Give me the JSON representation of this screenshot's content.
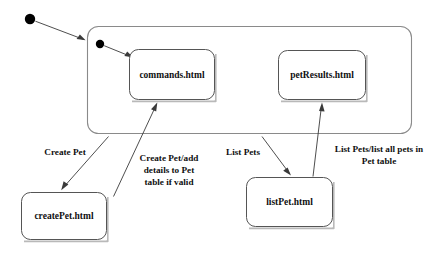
{
  "diagram": {
    "type": "uml-statechart",
    "title_visible": false,
    "background_color": "#ffffff",
    "line_color": "#3a3a3a",
    "box_stroke_color": "#555555",
    "container_stroke_color": "#8a8a8a",
    "text_color": "#101010",
    "outer_start": {
      "name": "outer-initial-state",
      "shape": "filled-circle",
      "cx": 30,
      "cy": 19,
      "r": 5.2
    },
    "container": {
      "name": "composite-state",
      "label": "",
      "x": 87,
      "y": 26,
      "width": 325,
      "height": 108,
      "radius": 11
    },
    "inner_start": {
      "name": "inner-initial-state",
      "shape": "filled-circle",
      "cx": 100,
      "cy": 44,
      "r": 4.2
    },
    "states": [
      {
        "id": "commands",
        "label": "commands.html",
        "x": 129,
        "y": 49,
        "width": 86,
        "height": 51,
        "radius": 9
      },
      {
        "id": "petResults",
        "label": "petResults.html",
        "x": 278,
        "y": 50,
        "width": 88,
        "height": 50,
        "radius": 9
      },
      {
        "id": "createPet",
        "label": "createPet.html",
        "x": 21,
        "y": 192,
        "width": 86,
        "height": 48,
        "radius": 9
      },
      {
        "id": "listPet",
        "label": "listPet.html",
        "x": 246,
        "y": 177,
        "width": 87,
        "height": 50,
        "radius": 9
      }
    ],
    "transitions": [
      {
        "id": "start-to-container",
        "from": "outer-initial-state",
        "to": "composite-state",
        "label": "",
        "points": "35,21 86,40"
      },
      {
        "id": "inner-start-to-commands",
        "from": "inner-initial-state",
        "to": "commands",
        "label": "",
        "points": "104,46 134,58"
      },
      {
        "id": "commands-to-createPet",
        "from": "composite-state",
        "to": "createPet",
        "label": "Create Pet",
        "label_lines": [
          "Create Pet"
        ],
        "label_x": 65,
        "label_y": 155,
        "label_align": "center",
        "points": "108,136 61,190"
      },
      {
        "id": "createPet-to-commands",
        "from": "createPet",
        "to": "commands",
        "label": "Create Pet/add details to Pet table if valid",
        "label_lines": [
          "Create Pet/add",
          "details to Pet",
          "table if valid"
        ],
        "label_x": 169,
        "label_y": 165,
        "label_align": "center",
        "points": "113,195 156,103"
      },
      {
        "id": "commands-to-listPet",
        "from": "composite-state",
        "to": "listPet",
        "label": "List Pets",
        "label_lines": [
          "List Pets"
        ],
        "label_x": 243,
        "label_y": 155,
        "label_align": "center",
        "points": "262,136 291,175"
      },
      {
        "id": "listPet-to-petResults",
        "from": "listPet",
        "to": "petResults",
        "label": "List Pets/list all pets in Pet table",
        "label_lines": [
          "List Pets/list all pets in",
          "Pet table"
        ],
        "label_x": 379,
        "label_y": 152,
        "label_align": "center",
        "points": "313,176 322,103"
      }
    ]
  }
}
